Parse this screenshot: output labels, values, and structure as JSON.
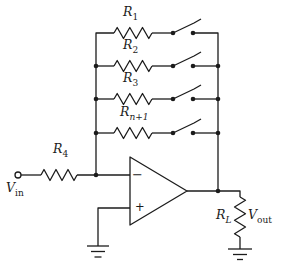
{
  "figure": {
    "kind": "opamp-circuit-schematic",
    "colors": {
      "line": "#1c1c1c",
      "background": "#ffffff"
    },
    "labels": {
      "r1": {
        "main": "R",
        "sub": "1"
      },
      "r2": {
        "main": "R",
        "sub": "2"
      },
      "r3": {
        "main": "R",
        "sub": "3"
      },
      "rn1": {
        "main": "R",
        "sub": "n+1"
      },
      "r4": {
        "main": "R",
        "sub": "4"
      },
      "rl": {
        "main": "R",
        "sub": "L"
      },
      "vin": {
        "main": "V",
        "sub": "in"
      },
      "vout": {
        "main": "V",
        "sub": "out"
      }
    },
    "opamp": {
      "inverting_sign": "−",
      "noninverting_sign": "+"
    },
    "switches": {
      "count": 4,
      "state": "open"
    }
  }
}
